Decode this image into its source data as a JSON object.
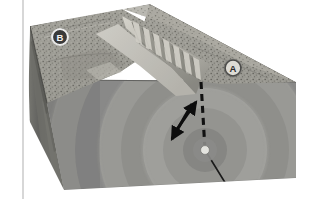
{
  "figure": {
    "width": 313,
    "height": 199,
    "background_color": "#ffffff"
  },
  "margin_rule": {
    "name": "page-margin-line",
    "color": "#b9b9b9",
    "x": 23
  },
  "markers": [
    {
      "id": "B",
      "label": "B",
      "x": 60,
      "y": 37,
      "radius": 8.5,
      "style": "dark-fill-light-text",
      "fill": "#3b3b3b",
      "text_color": "#f2f2f2",
      "ring_color": "#e8e8e8"
    },
    {
      "id": "A",
      "label": "A",
      "x": 233,
      "y": 68,
      "radius": 8.5,
      "style": "light-fill-dark-text",
      "fill": "#d8d8d6",
      "text_color": "#2f2f2f",
      "ring_color": "#555555"
    }
  ],
  "focus": {
    "name": "earthquake-focus",
    "label": "",
    "x": 205,
    "y": 150,
    "dot_radius": 4.2,
    "dot_color": "#e2e2dd",
    "halo_radius": 12,
    "halo_color": "#8e8e8e"
  },
  "epicentre_line": {
    "name": "epicentre-dashed-line",
    "color": "#1a1a1a",
    "dash": "7 5",
    "width": 3.1,
    "from": {
      "x": 201,
      "y": 82
    },
    "to": {
      "x": 205,
      "y": 150
    }
  },
  "fault_plane_line": {
    "name": "fault-plane-line",
    "color": "#1a1a1a",
    "width": 1.6,
    "from": {
      "x": 205,
      "y": 150
    },
    "to": {
      "x": 229,
      "y": 189
    }
  },
  "slip_arrows": [
    {
      "name": "slip-arrow-up",
      "direction": "up-right",
      "color": "#0d0d0d",
      "from": {
        "x": 173,
        "y": 135
      },
      "to": {
        "x": 196,
        "y": 102
      }
    },
    {
      "name": "slip-arrow-down",
      "direction": "down-left",
      "color": "#0d0d0d",
      "from": {
        "x": 192,
        "y": 104
      },
      "to": {
        "x": 172,
        "y": 139
      }
    }
  ],
  "wave_rings": {
    "name": "seismic-wave-rings",
    "center": {
      "x": 205,
      "y": 150
    },
    "radii": [
      22,
      42,
      62,
      84,
      106,
      130,
      156,
      184
    ],
    "colors": [
      "#a8a8a4",
      "#9a9a96",
      "#a6a6a2",
      "#979793",
      "#a2a29e",
      "#949490",
      "#9f9f9b",
      "#919190"
    ]
  },
  "block": {
    "front_face_color": "#9d9d99",
    "left_face_color": "#6b6b6b",
    "left_face_shade": "#5d5d5d",
    "top_surface_color": "#9b9a93",
    "top_surface_light": "#b6b4ac",
    "scarp_color": "#c4c2ba",
    "valley_color": "#b4b3ac",
    "edge_color": "#555553"
  },
  "captions": {
    "hanging_wall": "A",
    "footwall": "B"
  }
}
